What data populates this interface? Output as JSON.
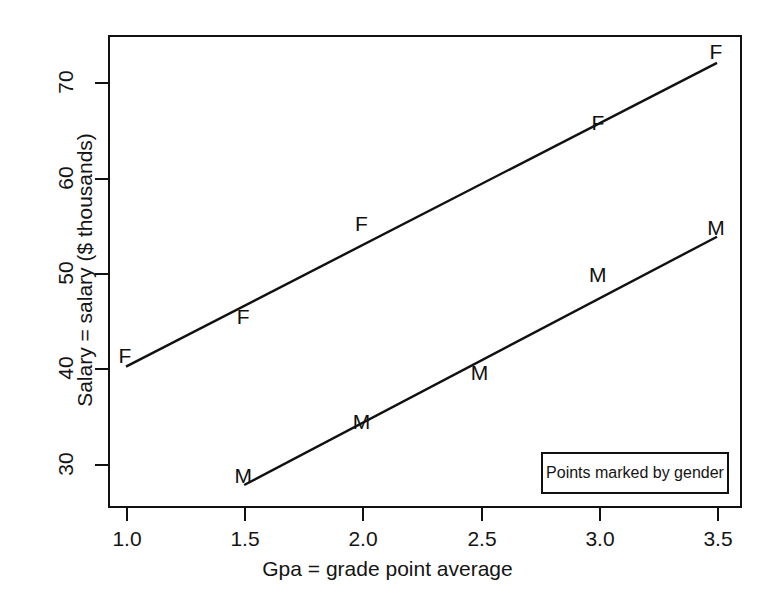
{
  "chart_data": {
    "type": "scatter",
    "title": "",
    "subtitle": "",
    "xlabel": "Gpa = grade point average",
    "ylabel": "Salary = salary ($ thousands)",
    "xlim": [
      0.88,
      3.62
    ],
    "ylim": [
      25.4,
      74.9
    ],
    "xticks": [
      "1.0",
      "1.5",
      "2.0",
      "2.5",
      "3.0",
      "3.5"
    ],
    "xtick_values": [
      1.0,
      1.5,
      2.0,
      2.5,
      3.0,
      3.5
    ],
    "yticks": [
      "30",
      "40",
      "50",
      "60",
      "70"
    ],
    "ytick_values": [
      30,
      40,
      50,
      60,
      70
    ],
    "grid": false,
    "legend_position": "bottom-right",
    "legend_text": "Points marked by gender",
    "annotations": [
      "Points marked by gender"
    ],
    "series": [
      {
        "name": "F",
        "marker": "F",
        "line": true,
        "x": [
          1.0,
          1.5,
          2.0,
          3.0,
          3.5
        ],
        "y": [
          40.2,
          44.2,
          54.0,
          64.6,
          72.0
        ],
        "line_endpoints": [
          [
            1.0,
            40.2
          ],
          [
            3.5,
            72.0
          ]
        ]
      },
      {
        "name": "M",
        "marker": "M",
        "line": true,
        "x": [
          1.5,
          2.0,
          2.5,
          3.0,
          3.5
        ],
        "y": [
          27.8,
          33.5,
          38.6,
          48.8,
          53.8
        ],
        "line_endpoints": [
          [
            1.5,
            27.8
          ],
          [
            3.5,
            53.8
          ]
        ]
      }
    ]
  },
  "axes": {
    "y_tick_labels": [
      "30",
      "40",
      "50",
      "60",
      "70"
    ],
    "x_tick_labels": [
      "1.0",
      "1.5",
      "2.0",
      "2.5",
      "3.0",
      "3.5"
    ],
    "x_title": "Gpa = grade point average",
    "y_title": "Salary = salary ($ thousands)"
  },
  "legend": {
    "text": "Points marked by gender"
  },
  "markers": {
    "f_labels": [
      "F",
      "F",
      "F",
      "F",
      "F"
    ],
    "m_labels": [
      "M",
      "M",
      "M",
      "M",
      "M"
    ]
  },
  "colors": {
    "ink": "#111111",
    "background": "#ffffff"
  }
}
